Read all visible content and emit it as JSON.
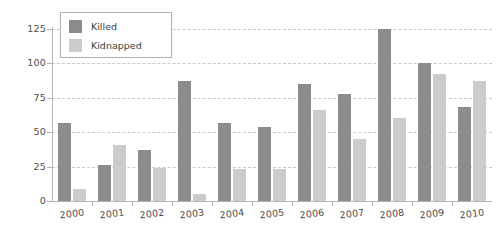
{
  "chart_data": {
    "type": "bar",
    "title": "",
    "subtitle": "",
    "xlabel": "",
    "ylabel": "",
    "categories": [
      "2000",
      "2001",
      "2002",
      "2003",
      "2004",
      "2005",
      "2006",
      "2007",
      "2008",
      "2009",
      "2010"
    ],
    "series": [
      {
        "name": "Killed",
        "color": "#8c8c8c",
        "values": [
          57,
          26,
          37,
          87,
          57,
          54,
          85,
          78,
          125,
          100,
          68
        ]
      },
      {
        "name": "Kidnapped",
        "color": "#cccccc",
        "values": [
          9,
          41,
          24,
          5,
          23,
          23,
          66,
          45,
          60,
          92,
          87
        ]
      }
    ],
    "ylim": [
      0,
      130
    ],
    "yticks": [
      0,
      25,
      50,
      75,
      100,
      125
    ],
    "ytick_labels": [
      "0",
      "25",
      "50",
      "75",
      "100",
      "125"
    ],
    "grid": true,
    "grid_axis": "y",
    "grid_style": "dashed",
    "grid_color": "#c9c9c9",
    "legend_position": "top-left",
    "legend_entries": [
      "Killed",
      "Kidnapped"
    ],
    "background_color": "#ffffff",
    "axis_color": "#b3b3b3",
    "tick_label_color": "#4d4d4d",
    "xtick_label_rotation": -7
  }
}
